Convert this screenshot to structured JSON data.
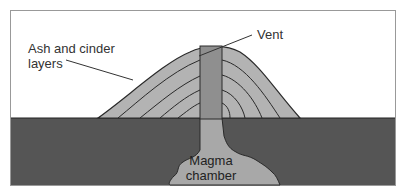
{
  "labels": {
    "ash_cinder": "Ash and cinder layers",
    "ash_cinder_line1": "Ash and cinder",
    "ash_cinder_line2": "layers",
    "vent": "Vent",
    "magma_line1": "Magma",
    "magma_line2": "chamber"
  },
  "colors": {
    "cone": "#b3b3b3",
    "vent": "#8f8f8f",
    "ground": "#555555",
    "magma": "#a8a8a8",
    "outline": "#2a2a2a",
    "sky": "#ffffff"
  }
}
